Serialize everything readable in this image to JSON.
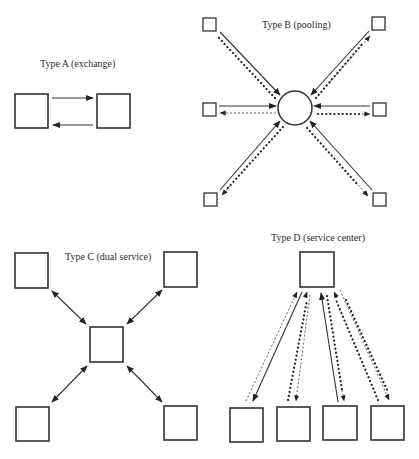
{
  "diagrams": {
    "type_a": {
      "title": "Type A (exchange)",
      "nodes": 2,
      "links": [
        "solid arrow left→right",
        "solid arrow right→left"
      ]
    },
    "type_b": {
      "title": "Type B (pooling)",
      "center": "circle",
      "nodes": 6,
      "links": [
        "solid arrows to center",
        "dashed arrows from center",
        "dotted arrows from center"
      ]
    },
    "type_c": {
      "title": "Type C (dual service)",
      "center": "square",
      "nodes": 4,
      "links": [
        "double-headed solid arrows between center and each node"
      ]
    },
    "type_d": {
      "title": "Type D (service center)",
      "center": "square (top)",
      "nodes": 4,
      "links": [
        "solid, dashed and dotted arrows between service center and bottom nodes"
      ]
    }
  },
  "colors": {
    "ink": "#333333",
    "background": "#ffffff"
  }
}
